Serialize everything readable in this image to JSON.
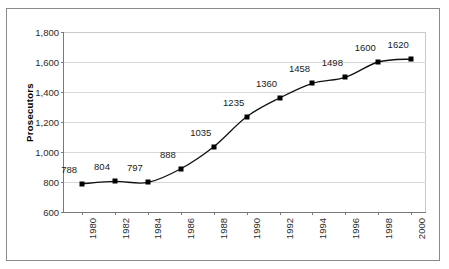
{
  "chart_data": {
    "type": "line",
    "title": "",
    "xlabel": "",
    "ylabel": "Prosecutors",
    "categories": [
      "1980",
      "1982",
      "1984",
      "1986",
      "1988",
      "1990",
      "1992",
      "1994",
      "1996",
      "1998",
      "2000"
    ],
    "values": [
      788,
      804,
      797,
      888,
      1035,
      1235,
      1360,
      1458,
      1498,
      1600,
      1620
    ],
    "point_labels": [
      "788",
      "804",
      "797",
      "888",
      "1035",
      "1235",
      "1360",
      "1458",
      "1498",
      "1600",
      "1620"
    ],
    "ylim": [
      600,
      1800
    ],
    "y_ticks": [
      600,
      800,
      1000,
      1200,
      1400,
      1600,
      1800
    ],
    "y_tick_labels": [
      "600",
      "800",
      "1,000",
      "1,200",
      "1,400",
      "1,600",
      "1,800"
    ],
    "grid": true,
    "legend": "none",
    "series_color": "#000000",
    "marker": "square",
    "line_smoothing": true
  },
  "axes": {
    "y_title": "Prosecutors"
  },
  "style": {
    "frame_color": "#8a8a8a",
    "gridline_color": "#d8d8d8",
    "axis_color": "#7a7a7a",
    "background": "#ffffff"
  }
}
